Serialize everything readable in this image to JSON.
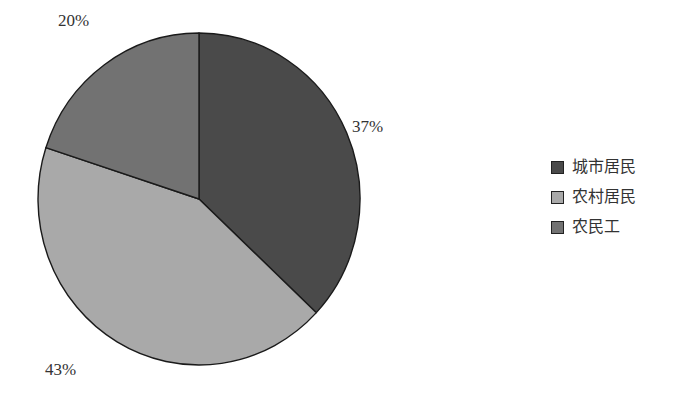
{
  "chart_data": {
    "type": "pie",
    "title": "",
    "categories": [
      "城市居民",
      "农村居民",
      "农民工"
    ],
    "values": [
      37,
      43,
      20
    ],
    "labels": [
      "37%",
      "43%",
      "20%"
    ],
    "colors": [
      "#4a4a4a",
      "#a9a9a9",
      "#727272"
    ],
    "start_angle": "12 o'clock",
    "direction": "clockwise",
    "legend_position": "right"
  },
  "legend": {
    "items": [
      {
        "label": "城市居民",
        "color": "#4a4a4a"
      },
      {
        "label": "农村居民",
        "color": "#a9a9a9"
      },
      {
        "label": "农民工",
        "color": "#727272"
      }
    ]
  },
  "slice_labels": {
    "urban": "37%",
    "rural": "43%",
    "migrant": "20%"
  }
}
